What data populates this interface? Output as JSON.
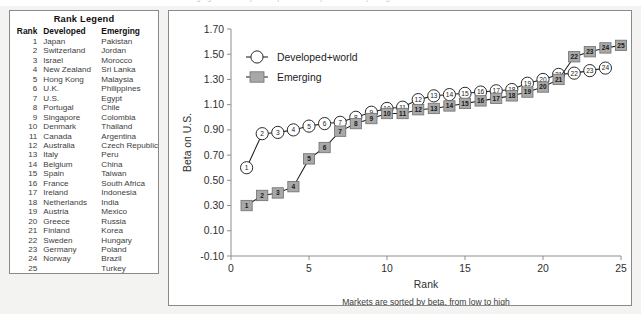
{
  "top_cut_text": "hedging of currency risk represented by the currency hedge ratio",
  "legend_panel": {
    "title": "Rank Legend",
    "columns": [
      "Rank",
      "Developed",
      "Emerging"
    ],
    "rows": [
      [
        "1",
        "Japan",
        "Pakistan"
      ],
      [
        "2",
        "Switzerland",
        "Jordan"
      ],
      [
        "3",
        "Israel",
        "Morocco"
      ],
      [
        "4",
        "New Zealand",
        "Sri Lanka"
      ],
      [
        "5",
        "Hong Kong",
        "Malaysia"
      ],
      [
        "6",
        "U.K.",
        "Philippines"
      ],
      [
        "7",
        "U.S.",
        "Egypt"
      ],
      [
        "8",
        "Portugal",
        "Chile"
      ],
      [
        "9",
        "Singapore",
        "Colombia"
      ],
      [
        "10",
        "Denmark",
        "Thailand"
      ],
      [
        "11",
        "Canada",
        "Argentina"
      ],
      [
        "12",
        "Australia",
        "Czech Republic"
      ],
      [
        "13",
        "Italy",
        "Peru"
      ],
      [
        "14",
        "Belgium",
        "China"
      ],
      [
        "15",
        "Spain",
        "Taiwan"
      ],
      [
        "16",
        "France",
        "South Africa"
      ],
      [
        "17",
        "Ireland",
        "Indonesia"
      ],
      [
        "18",
        "Netherlands",
        "India"
      ],
      [
        "19",
        "Austria",
        "Mexico"
      ],
      [
        "20",
        "Greece",
        "Russia"
      ],
      [
        "21",
        "Finland",
        "Korea"
      ],
      [
        "22",
        "Sweden",
        "Hungary"
      ],
      [
        "23",
        "Germany",
        "Poland"
      ],
      [
        "24",
        "Norway",
        "Brazil"
      ],
      [
        "25",
        "",
        "Turkey"
      ]
    ]
  },
  "chart_data": {
    "type": "line",
    "title": "",
    "xlabel": "Rank",
    "ylabel": "Beta on U.S.",
    "caption": "Markets are sorted by beta, from low to high",
    "xlim": [
      0,
      25
    ],
    "ylim": [
      -0.1,
      1.7
    ],
    "xticks": [
      0,
      5,
      10,
      15,
      20,
      25
    ],
    "xticklabels": [
      "0",
      "5",
      "10",
      "15",
      "20",
      "25"
    ],
    "yticks": [
      -0.1,
      0.1,
      0.3,
      0.5,
      0.7,
      0.9,
      1.1,
      1.3,
      1.5,
      1.7
    ],
    "yticklabels": [
      "-0.10",
      "0.10",
      "0.30",
      "0.50",
      "0.70",
      "0.90",
      "1.10",
      "1.30",
      "1.50",
      "1.70"
    ],
    "grid": false,
    "legend_position": "upper-left",
    "marker_labels": true,
    "series": [
      {
        "name": "Developed+world",
        "marker": "circle",
        "x": [
          1,
          2,
          3,
          4,
          5,
          6,
          7,
          8,
          9,
          10,
          11,
          12,
          13,
          14,
          15,
          16,
          17,
          18,
          19,
          20,
          21,
          22,
          23,
          24
        ],
        "values": [
          0.6,
          0.87,
          0.88,
          0.9,
          0.93,
          0.95,
          0.96,
          1.0,
          1.04,
          1.07,
          1.08,
          1.14,
          1.17,
          1.18,
          1.19,
          1.2,
          1.21,
          1.22,
          1.27,
          1.3,
          1.34,
          1.35,
          1.37,
          1.39
        ],
        "point_labels": [
          "1",
          "2",
          "3",
          "4",
          "5",
          "6",
          "7",
          "8",
          "9",
          "10",
          "11",
          "12",
          "13",
          "14",
          "15",
          "16",
          "17",
          "18",
          "19",
          "20",
          "21",
          "22",
          "23",
          "24"
        ]
      },
      {
        "name": "Emerging",
        "marker": "square",
        "x": [
          1,
          2,
          3,
          4,
          5,
          6,
          7,
          8,
          9,
          10,
          11,
          12,
          13,
          14,
          15,
          16,
          17,
          18,
          19,
          20,
          21,
          22,
          23,
          24,
          25
        ],
        "values": [
          0.3,
          0.38,
          0.4,
          0.45,
          0.67,
          0.76,
          0.89,
          0.95,
          0.99,
          1.03,
          1.03,
          1.06,
          1.07,
          1.09,
          1.11,
          1.13,
          1.15,
          1.17,
          1.2,
          1.24,
          1.3,
          1.48,
          1.52,
          1.55,
          1.57
        ],
        "point_labels": [
          "1",
          "2",
          "3",
          "4",
          "5",
          "6",
          "7",
          "8",
          "9",
          "10",
          "11",
          "12",
          "13",
          "14",
          "15",
          "16",
          "17",
          "18",
          "19",
          "20",
          "21",
          "22",
          "23",
          "24",
          "25"
        ]
      }
    ]
  }
}
